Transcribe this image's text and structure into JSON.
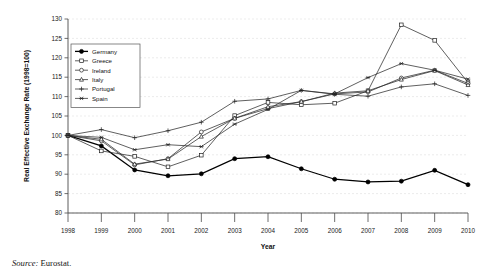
{
  "figure": {
    "source_label": "Source:",
    "source_value": "Eurostat."
  },
  "chart_data": {
    "type": "line",
    "title": "",
    "xlabel": "Year",
    "ylabel": "Real Effective Exchange Rate (1998=100)",
    "categories": [
      "1998",
      "1999",
      "2000",
      "2001",
      "2002",
      "2003",
      "2004",
      "2005",
      "2006",
      "2007",
      "2008",
      "2009",
      "2010"
    ],
    "x": [
      1998,
      1999,
      2000,
      2001,
      2002,
      2003,
      2004,
      2005,
      2006,
      2007,
      2008,
      2009,
      2010
    ],
    "xlim": [
      1998,
      2010
    ],
    "ylim": [
      80,
      130
    ],
    "yticks": [
      80,
      85,
      90,
      95,
      100,
      105,
      110,
      115,
      120,
      125,
      130
    ],
    "grid": true,
    "legend_position": "upper-left",
    "series": [
      {
        "name": "Germany",
        "marker": "filled-circle",
        "emphasis": true,
        "values": [
          100.0,
          97.3,
          91.1,
          89.6,
          90.1,
          94.0,
          94.5,
          91.4,
          88.7,
          88.0,
          88.2,
          91.0,
          87.3
        ]
      },
      {
        "name": "Greece",
        "marker": "open-square",
        "emphasis": false,
        "values": [
          100.0,
          96.0,
          94.6,
          91.9,
          94.9,
          105.1,
          108.5,
          107.9,
          108.3,
          111.5,
          128.5,
          124.5,
          113.6
        ]
      },
      {
        "name": "Ireland",
        "marker": "open-circle",
        "emphasis": false,
        "values": [
          100.0,
          98.6,
          92.4,
          94.0,
          100.9,
          104.4,
          106.9,
          108.7,
          110.7,
          111.2,
          114.8,
          116.8,
          113.4
        ]
      },
      {
        "name": "Italy",
        "marker": "open-triangle",
        "emphasis": false,
        "values": [
          100.0,
          99.0,
          92.6,
          93.9,
          99.7,
          104.4,
          107.4,
          108.7,
          110.9,
          111.5,
          114.4,
          116.7,
          113.0
        ]
      },
      {
        "name": "Portugal",
        "marker": "plus",
        "emphasis": false,
        "values": [
          100.0,
          101.5,
          99.4,
          101.2,
          103.4,
          108.8,
          109.4,
          111.6,
          110.6,
          110.1,
          112.5,
          113.3,
          110.3
        ]
      },
      {
        "name": "Spain",
        "marker": "asterisk",
        "emphasis": false,
        "values": [
          100.0,
          99.5,
          96.3,
          97.6,
          97.1,
          102.9,
          106.7,
          111.6,
          110.7,
          114.9,
          118.5,
          116.8,
          114.5
        ]
      }
    ]
  }
}
